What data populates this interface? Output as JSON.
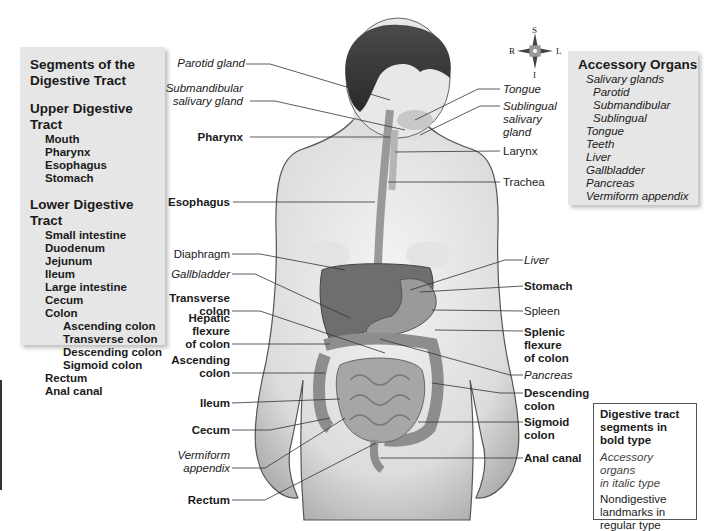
{
  "segments_panel": {
    "title_line1": "Segments of the",
    "title_line2": "Digestive Tract",
    "upper_heading": "Upper Digestive Tract",
    "upper_items": [
      "Mouth",
      "Pharynx",
      "Esophagus",
      "Stomach"
    ],
    "lower_heading": "Lower Digestive Tract",
    "lower_items": [
      "Small intestine",
      "Duodenum",
      "Jejunum",
      "Ileum",
      "Large intestine",
      "Cecum",
      "Colon"
    ],
    "colon_items": [
      "Ascending colon",
      "Transverse colon",
      "Descending colon",
      "Sigmoid colon"
    ],
    "lower_tail": [
      "Rectum",
      "Anal canal"
    ]
  },
  "accessory_panel": {
    "title": "Accessory Organs",
    "salivary": "Salivary glands",
    "salivary_items": [
      "Parotid",
      "Submandibular",
      "Sublingual"
    ],
    "items": [
      "Tongue",
      "Teeth",
      "Liver",
      "Gallbladder",
      "Pancreas",
      "Vermiform appendix"
    ]
  },
  "compass": {
    "S": "S",
    "I": "I",
    "R": "R",
    "L": "L"
  },
  "labels_left": {
    "parotid": "Parotid gland",
    "submandibular_1": "Submandibular",
    "submandibular_2": "salivary gland",
    "pharynx": "Pharynx",
    "esophagus": "Esophagus",
    "diaphragm": "Diaphragm",
    "gallbladder": "Gallbladder",
    "transverse_1": "Transverse",
    "transverse_2": "colon",
    "hepatic_1": "Hepatic",
    "hepatic_2": "flexure",
    "hepatic_3": "of colon",
    "ascending_1": "Ascending",
    "ascending_2": "colon",
    "ileum": "Ileum",
    "cecum": "Cecum",
    "appendix_1": "Vermiform",
    "appendix_2": "appendix",
    "rectum": "Rectum"
  },
  "labels_right": {
    "tongue": "Tongue",
    "sublingual_1": "Sublingual",
    "sublingual_2": "salivary",
    "sublingual_3": "gland",
    "larynx": "Larynx",
    "trachea": "Trachea",
    "liver": "Liver",
    "stomach": "Stomach",
    "spleen": "Spleen",
    "splenic_1": "Splenic",
    "splenic_2": "flexure",
    "splenic_3": "of colon",
    "pancreas": "Pancreas",
    "descending_1": "Descending",
    "descending_2": "colon",
    "sigmoid_1": "Sigmoid",
    "sigmoid_2": "colon",
    "anal": "Anal canal"
  },
  "legend": {
    "bold_1": "Digestive tract",
    "bold_2": "segments in",
    "bold_3": "bold type",
    "italic_1": "Accessory organs",
    "italic_2": "in italic type",
    "regular_1": "Nondigestive",
    "regular_2": "landmarks in",
    "regular_3": "regular type"
  }
}
